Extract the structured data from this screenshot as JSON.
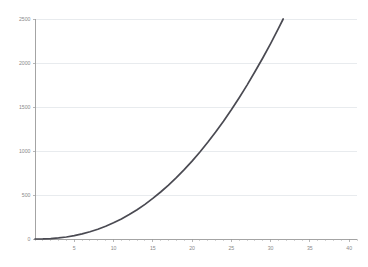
{
  "chart_data": {
    "type": "line",
    "title": "",
    "subtitle": "",
    "xlabel": "",
    "ylabel": "",
    "xlim": [
      0,
      41
    ],
    "ylim": [
      0,
      2500
    ],
    "grid": true,
    "grid_axis": "y",
    "legend": false,
    "legend_position": "none",
    "series": [
      {
        "name": "curve",
        "color": "#4a4a52",
        "x": [
          0,
          1,
          2,
          3,
          4,
          5,
          6,
          7,
          8,
          9,
          10,
          11,
          12,
          13,
          14,
          15,
          16,
          17,
          18,
          19,
          20,
          21,
          22,
          23,
          24,
          25,
          26,
          27,
          28,
          29,
          30,
          31,
          32,
          33,
          34,
          35,
          36,
          37,
          38,
          39,
          40
        ],
        "values": [
          0,
          1,
          5,
          12,
          23,
          38,
          58,
          82,
          111,
          145,
          184,
          228,
          278,
          333,
          394,
          461,
          534,
          612,
          697,
          788,
          885,
          989,
          1099,
          1216,
          1339,
          1469,
          1606,
          1749,
          1900,
          2057,
          2221,
          2393,
          2571,
          2757,
          2950,
          3150,
          3357,
          3572,
          3794,
          4024,
          4261
        ]
      }
    ],
    "x_ticks": [
      {
        "value": 5,
        "label": "5"
      },
      {
        "value": 10,
        "label": "10"
      },
      {
        "value": 15,
        "label": "15"
      },
      {
        "value": 20,
        "label": "20"
      },
      {
        "value": 25,
        "label": "25"
      },
      {
        "value": 30,
        "label": "30"
      },
      {
        "value": 35,
        "label": "35"
      },
      {
        "value": 40,
        "label": "40"
      }
    ],
    "x_minor_tick_step": 1,
    "y_ticks": [
      {
        "value": 0,
        "label": "0"
      },
      {
        "value": 500,
        "label": "500"
      },
      {
        "value": 1000,
        "label": "1000"
      },
      {
        "value": 1500,
        "label": "1500"
      },
      {
        "value": 2000,
        "label": "2000"
      },
      {
        "value": 2500,
        "label": "2500"
      }
    ],
    "colors": {
      "background": "#ffffff",
      "series": "#4a4a52",
      "gridline": "#d8dde2",
      "axis": "#9a9a9a",
      "tick_text": "#8a8a8a"
    }
  },
  "plot_geometry": {
    "left": 35,
    "right": 357,
    "top": 19,
    "bottom": 239
  }
}
